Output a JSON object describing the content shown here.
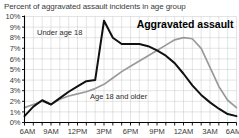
{
  "chart_data": {
    "type": "line",
    "title": "Percent of aggravated assault incidents in age group",
    "annotation_title": "Aggravated assault",
    "xlabel": "",
    "ylabel": "",
    "ylim": [
      0,
      10
    ],
    "y_tick_labels": [
      "0%",
      "1%",
      "2%",
      "3%",
      "4%",
      "5%",
      "6%",
      "7%",
      "8%",
      "9%",
      "10%"
    ],
    "y_tick_values": [
      0,
      1,
      2,
      3,
      4,
      5,
      6,
      7,
      8,
      9,
      10
    ],
    "x_tick_labels": [
      "6AM",
      "9AM",
      "12PM",
      "3PM",
      "6PM",
      "9PM",
      "12AM",
      "3AM",
      "6AM"
    ],
    "x_tick_values": [
      0,
      3,
      6,
      9,
      12,
      15,
      18,
      21,
      24
    ],
    "x_minor_tick_count": 25,
    "grid": true,
    "legend_position": "inline-annotations",
    "x": [
      0,
      1,
      2,
      3,
      4,
      5,
      6,
      7,
      8,
      9,
      10,
      11,
      12,
      13,
      14,
      15,
      16,
      17,
      18,
      19,
      20,
      21,
      22,
      23,
      24
    ],
    "x_hours": [
      "6AM",
      "7AM",
      "8AM",
      "9AM",
      "10AM",
      "11AM",
      "12PM",
      "1PM",
      "2PM",
      "3PM",
      "4PM",
      "5PM",
      "6PM",
      "7PM",
      "8PM",
      "9PM",
      "10PM",
      "11PM",
      "12AM",
      "1AM",
      "2AM",
      "3AM",
      "4AM",
      "5AM",
      "6AM"
    ],
    "series": [
      {
        "name": "Under age 18",
        "color": "#111111",
        "values": [
          0.6,
          1.5,
          2.1,
          1.7,
          2.3,
          2.9,
          3.4,
          3.9,
          4.0,
          9.6,
          8.0,
          7.4,
          7.4,
          7.4,
          7.2,
          6.8,
          6.3,
          5.6,
          4.6,
          3.5,
          2.6,
          1.9,
          1.3,
          0.8,
          0.6
        ]
      },
      {
        "name": "Age 18 and older",
        "color": "#9a9a9a",
        "values": [
          1.4,
          1.7,
          2.0,
          1.7,
          2.2,
          2.5,
          2.7,
          2.9,
          3.2,
          3.6,
          4.2,
          4.8,
          5.3,
          5.8,
          6.3,
          6.8,
          7.3,
          7.8,
          8.0,
          7.9,
          7.0,
          5.2,
          3.4,
          2.1,
          1.4
        ]
      }
    ],
    "annotations": [
      {
        "text": "Under age 18",
        "x_px": 37,
        "y_px": 35
      },
      {
        "text": "Age 18 and older",
        "x_px": 90,
        "y_px": 99
      }
    ]
  }
}
